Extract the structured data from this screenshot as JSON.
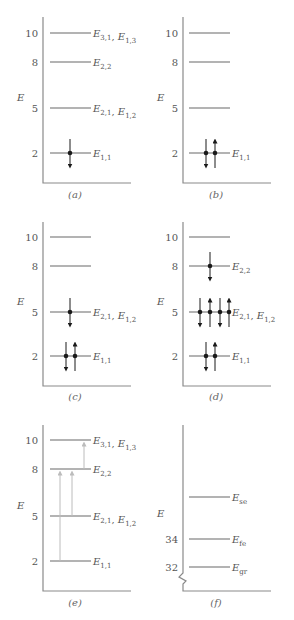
{
  "figure": {
    "axis_label": "E",
    "panels": [
      {
        "id": "a",
        "caption": "(a)",
        "levels": [
          {
            "value": 10,
            "tick": "10",
            "labels": [
              {
                "base": "E",
                "sub": "3,1"
              },
              {
                "base": "E",
                "sub": "1,3"
              }
            ],
            "electrons": []
          },
          {
            "value": 8,
            "tick": "8",
            "labels": [
              {
                "base": "E",
                "sub": "2,2"
              }
            ],
            "electrons": []
          },
          {
            "value": 5,
            "tick": "5",
            "labels": [
              {
                "base": "E",
                "sub": "2,1"
              },
              {
                "base": "E",
                "sub": "1,2"
              }
            ],
            "electrons": []
          },
          {
            "value": 2,
            "tick": "2",
            "labels": [
              {
                "base": "E",
                "sub": "1,1"
              }
            ],
            "electrons": [
              "down"
            ]
          }
        ],
        "transitions": []
      },
      {
        "id": "b",
        "caption": "(b)",
        "levels": [
          {
            "value": 10,
            "tick": "10",
            "labels": [],
            "electrons": []
          },
          {
            "value": 8,
            "tick": "8",
            "labels": [],
            "electrons": []
          },
          {
            "value": 5,
            "tick": "5",
            "labels": [],
            "electrons": []
          },
          {
            "value": 2,
            "tick": "2",
            "labels": [
              {
                "base": "E",
                "sub": "1,1"
              }
            ],
            "electrons": [
              "down",
              "up"
            ]
          }
        ],
        "transitions": []
      },
      {
        "id": "c",
        "caption": "(c)",
        "levels": [
          {
            "value": 10,
            "tick": "10",
            "labels": [],
            "electrons": []
          },
          {
            "value": 8,
            "tick": "8",
            "labels": [],
            "electrons": []
          },
          {
            "value": 5,
            "tick": "5",
            "labels": [
              {
                "base": "E",
                "sub": "2,1"
              },
              {
                "base": "E",
                "sub": "1,2"
              }
            ],
            "electrons": [
              "down"
            ]
          },
          {
            "value": 2,
            "tick": "2",
            "labels": [
              {
                "base": "E",
                "sub": "1,1"
              }
            ],
            "electrons": [
              "down",
              "up"
            ]
          }
        ],
        "transitions": []
      },
      {
        "id": "d",
        "caption": "(d)",
        "levels": [
          {
            "value": 10,
            "tick": "10",
            "labels": [],
            "electrons": []
          },
          {
            "value": 8,
            "tick": "8",
            "labels": [
              {
                "base": "E",
                "sub": "2,2"
              }
            ],
            "electrons": [
              "down"
            ]
          },
          {
            "value": 5,
            "tick": "5",
            "labels": [
              {
                "base": "E",
                "sub": "2,1"
              },
              {
                "base": "E",
                "sub": "1,2"
              }
            ],
            "electrons": [
              "down",
              "up",
              "down",
              "up"
            ]
          },
          {
            "value": 2,
            "tick": "2",
            "labels": [
              {
                "base": "E",
                "sub": "1,1"
              }
            ],
            "electrons": [
              "down",
              "up"
            ]
          }
        ],
        "transitions": []
      },
      {
        "id": "e",
        "caption": "(e)",
        "levels": [
          {
            "value": 10,
            "tick": "10",
            "labels": [
              {
                "base": "E",
                "sub": "3,1"
              },
              {
                "base": "E",
                "sub": "1,3"
              }
            ],
            "electrons": []
          },
          {
            "value": 8,
            "tick": "8",
            "labels": [
              {
                "base": "E",
                "sub": "2,2"
              }
            ],
            "electrons": []
          },
          {
            "value": 5,
            "tick": "5",
            "labels": [
              {
                "base": "E",
                "sub": "2,1"
              },
              {
                "base": "E",
                "sub": "1,2"
              }
            ],
            "electrons": []
          },
          {
            "value": 2,
            "tick": "2",
            "labels": [
              {
                "base": "E",
                "sub": "1,1"
              }
            ],
            "electrons": []
          }
        ],
        "transitions": [
          {
            "from": 2,
            "to": 8
          },
          {
            "from": 5,
            "to": 8
          },
          {
            "from": 8,
            "to": 10
          }
        ]
      },
      {
        "id": "f",
        "caption": "(f)",
        "axis_break": true,
        "levels": [
          {
            "value": 36.5,
            "tick": "",
            "labels": [
              {
                "base": "E",
                "sub": "se"
              }
            ],
            "electrons": []
          },
          {
            "value": 34,
            "tick": "34",
            "labels": [
              {
                "base": "E",
                "sub": "fe"
              }
            ],
            "electrons": []
          },
          {
            "value": 32,
            "tick": "32",
            "labels": [
              {
                "base": "E",
                "sub": "gr"
              }
            ],
            "electrons": []
          }
        ],
        "transitions": []
      }
    ],
    "colors": {
      "level_line": "#9a9a9a",
      "axis": "#8a8a8a",
      "electron": "#1a1a1a",
      "transition_arrow": "#bcbcbc",
      "text": "#555555"
    }
  }
}
